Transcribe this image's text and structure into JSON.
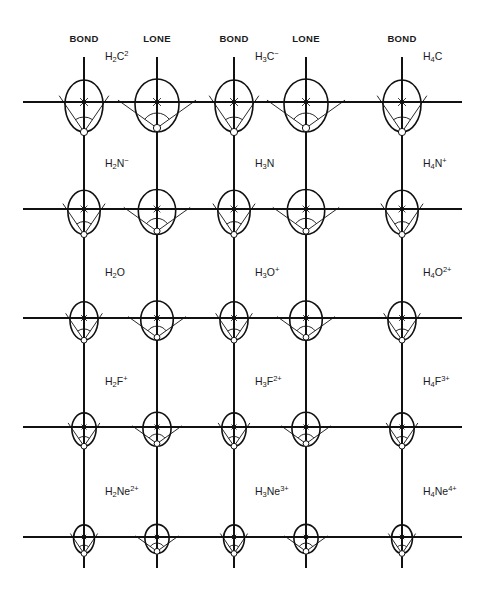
{
  "columns": [
    {
      "header": "BOND",
      "type": "bond"
    },
    {
      "header": "LONE",
      "type": "lone"
    },
    {
      "header": "BOND",
      "type": "bond"
    },
    {
      "header": "LONE",
      "type": "lone"
    },
    {
      "header": "BOND",
      "type": "bond"
    }
  ],
  "rows": [
    {
      "element": "C",
      "scale": 1.0,
      "labels": [
        {
          "after_column": 0,
          "h": "H",
          "sub": "2",
          "atom": "C",
          "sup": "2"
        },
        {
          "after_column": 2,
          "h": "H",
          "sub": "3",
          "atom": "C",
          "sup": "−"
        },
        {
          "after_column": 4,
          "h": "H",
          "sub": "4",
          "atom": "C",
          "sup": ""
        }
      ]
    },
    {
      "element": "N",
      "scale": 0.85,
      "labels": [
        {
          "after_column": 0,
          "h": "H",
          "sub": "2",
          "atom": "N",
          "sup": "−"
        },
        {
          "after_column": 2,
          "h": "H",
          "sub": "3",
          "atom": "N",
          "sup": ""
        },
        {
          "after_column": 4,
          "h": "H",
          "sub": "4",
          "atom": "N",
          "sup": "+"
        }
      ]
    },
    {
      "element": "O",
      "scale": 0.74,
      "labels": [
        {
          "after_column": 0,
          "h": "H",
          "sub": "2",
          "atom": "O",
          "sup": ""
        },
        {
          "after_column": 2,
          "h": "H",
          "sub": "3",
          "atom": "O",
          "sup": "+"
        },
        {
          "after_column": 4,
          "h": "H",
          "sub": "4",
          "atom": "O",
          "sup": "2+"
        }
      ]
    },
    {
      "element": "F",
      "scale": 0.64,
      "labels": [
        {
          "after_column": 0,
          "h": "H",
          "sub": "2",
          "atom": "F",
          "sup": "+"
        },
        {
          "after_column": 2,
          "h": "H",
          "sub": "3",
          "atom": "F",
          "sup": "2+"
        },
        {
          "after_column": 4,
          "h": "H",
          "sub": "4",
          "atom": "F",
          "sup": "3+"
        }
      ]
    },
    {
      "element": "Ne",
      "scale": 0.55,
      "labels": [
        {
          "after_column": 0,
          "h": "H",
          "sub": "2",
          "atom": "Ne",
          "sup": "2+"
        },
        {
          "after_column": 2,
          "h": "H",
          "sub": "3",
          "atom": "Ne",
          "sup": "3+"
        },
        {
          "after_column": 4,
          "h": "H",
          "sub": "4",
          "atom": "Ne",
          "sup": "4+"
        }
      ]
    }
  ],
  "colors": {
    "ink": "#111111",
    "background": "#ffffff"
  }
}
